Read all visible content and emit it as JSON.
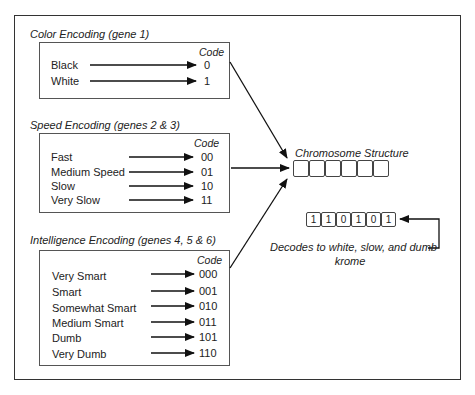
{
  "sections": [
    {
      "title": "Color Encoding (gene 1)",
      "code_header": "Code",
      "rows": [
        {
          "label": "Black",
          "code": "0"
        },
        {
          "label": "White",
          "code": "1"
        }
      ]
    },
    {
      "title": "Speed Encoding (genes 2 & 3)",
      "code_header": "Code",
      "rows": [
        {
          "label": "Fast",
          "code": "00"
        },
        {
          "label": "Medium Speed",
          "code": "01"
        },
        {
          "label": "Slow",
          "code": "10"
        },
        {
          "label": "Very Slow",
          "code": "11"
        }
      ]
    },
    {
      "title": "Intelligence Encoding (genes 4, 5 & 6)",
      "code_header": "Code",
      "rows": [
        {
          "label": "Very Smart",
          "code": "000"
        },
        {
          "label": "Smart",
          "code": "001"
        },
        {
          "label": "Somewhat Smart",
          "code": "010"
        },
        {
          "label": "Medium Smart",
          "code": "011"
        },
        {
          "label": "Dumb",
          "code": "101"
        },
        {
          "label": "Very Dumb",
          "code": "110"
        }
      ]
    }
  ],
  "chromosome": {
    "title": "Chromosome Structure",
    "slots": [
      "",
      "",
      "",
      "",
      "",
      ""
    ]
  },
  "example": {
    "bits": [
      "1",
      "1",
      "0",
      "1",
      "0",
      "1"
    ],
    "caption_line1": "Decodes to white, slow, and dumb",
    "caption_line2": "krome"
  }
}
